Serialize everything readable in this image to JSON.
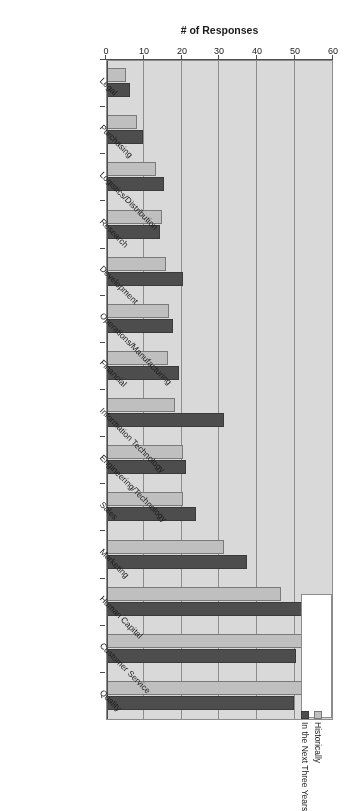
{
  "chart_data": {
    "type": "bar",
    "orientation": "horizontal",
    "title": "",
    "xlabel": "# of Responses",
    "ylabel": "",
    "xlim": [
      0,
      60
    ],
    "xticks": [
      0,
      10,
      20,
      30,
      40,
      50,
      60
    ],
    "grid": true,
    "legend_position": "top-left",
    "categories": [
      "Quality",
      "Customer Service",
      "Human Capital",
      "Marketing",
      "Sales",
      "Engineering/Technology",
      "Information Technology",
      "Financial",
      "Operations/Manufacturing",
      "Development",
      "Research",
      "Logistics/Distribution",
      "Purchasing",
      "Legal"
    ],
    "series": [
      {
        "name": "Historically",
        "color": "#bfbfbf",
        "values": [
          52,
          53,
          46,
          31,
          20,
          20,
          18,
          16,
          16.5,
          15.5,
          14.5,
          13,
          8,
          5
        ]
      },
      {
        "name": "In the Next Three Years",
        "color": "#4d4d4d",
        "values": [
          49.5,
          50,
          57,
          37,
          23.5,
          21,
          31,
          19,
          17.5,
          20,
          14,
          15,
          9.5,
          6
        ]
      }
    ]
  },
  "axis": {
    "value_axis_title": "# of Responses",
    "tick_labels": [
      "0",
      "10",
      "20",
      "30",
      "40",
      "50",
      "60"
    ]
  },
  "legend": {
    "entries": [
      {
        "label": "Historically",
        "swatch": "light-square-swatch"
      },
      {
        "label": "In the Next Three Years",
        "swatch": "dark-square-swatch"
      }
    ]
  }
}
